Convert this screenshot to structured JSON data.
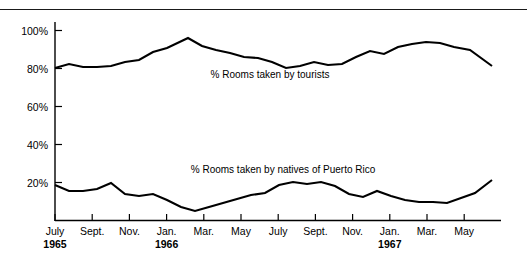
{
  "chart_data": {
    "type": "line",
    "title": "",
    "xlabel": "",
    "ylabel": "",
    "ylim": [
      0,
      107
    ],
    "grid": false,
    "legend_position": "inline-annotation",
    "y_ticks": [
      "20%",
      "40%",
      "60%",
      "80%",
      "100%"
    ],
    "y_tick_values": [
      20,
      40,
      60,
      80,
      100
    ],
    "x_tick_labels": [
      {
        "month": "July",
        "year": "1965"
      },
      {
        "month": "Sept.",
        "year": ""
      },
      {
        "month": "Nov.",
        "year": ""
      },
      {
        "month": "Jan.",
        "year": "1966"
      },
      {
        "month": "Mar.",
        "year": ""
      },
      {
        "month": "May",
        "year": ""
      },
      {
        "month": "July",
        "year": ""
      },
      {
        "month": "Sept.",
        "year": ""
      },
      {
        "month": "Nov.",
        "year": ""
      },
      {
        "month": "Jan.",
        "year": "1967"
      },
      {
        "month": "Mar.",
        "year": ""
      },
      {
        "month": "May",
        "year": ""
      }
    ],
    "x_months": [
      "Jul 1965",
      "Aug 1965",
      "Sep 1965",
      "Oct 1965",
      "Nov 1965",
      "Dec 1965",
      "Jan 1966",
      "Feb 1966",
      "Mar 1966",
      "Apr 1966",
      "May 1966",
      "Jun 1966",
      "Jul 1966",
      "Aug 1966",
      "Sep 1966",
      "Oct 1966",
      "Nov 1966",
      "Dec 1966",
      "Jan 1967",
      "Feb 1967",
      "Mar 1967",
      "Apr 1967",
      "May 1967",
      "Jun 1967"
    ],
    "series": [
      {
        "name": "% Rooms taken by tourists",
        "label": "% Rooms taken by tourists",
        "color": "#000000",
        "values": [
          81,
          84,
          82,
          82,
          83,
          86,
          88,
          92,
          96,
          91,
          89,
          88,
          87,
          83,
          80,
          82,
          81,
          86,
          91,
          89,
          92,
          94,
          94,
          93,
          91,
          83
        ]
      },
      {
        "name": "% Rooms taken by natives of Puerto Rico",
        "label": "% Rooms taken by natives of Puerto Rico",
        "color": "#000000",
        "values": [
          18,
          15,
          15,
          16,
          18,
          14,
          13,
          14,
          11,
          8,
          6,
          8,
          10,
          12,
          14,
          15,
          19,
          20,
          19,
          20,
          18,
          14,
          12,
          15,
          13,
          11,
          9,
          9,
          8,
          11,
          13,
          15,
          21
        ]
      }
    ],
    "annotations": [
      {
        "text": "% Rooms taken by tourists",
        "x_px": 270,
        "y_px": 78
      },
      {
        "text": "% Rooms taken by natives of Puerto Rico",
        "x_px": 283,
        "y_px": 173
      }
    ],
    "series_a_points": [
      [
        55,
        68
      ],
      [
        69,
        64
      ],
      [
        83,
        67
      ],
      [
        97,
        67
      ],
      [
        111,
        66
      ],
      [
        125,
        62
      ],
      [
        139,
        60
      ],
      [
        153,
        52
      ],
      [
        167,
        48
      ],
      [
        188,
        38
      ],
      [
        202,
        46
      ],
      [
        216,
        50
      ],
      [
        230,
        53
      ],
      [
        244,
        57
      ],
      [
        258,
        58
      ],
      [
        272,
        62
      ],
      [
        286,
        68
      ],
      [
        300,
        66
      ],
      [
        314,
        62
      ],
      [
        328,
        65
      ],
      [
        342,
        64
      ],
      [
        356,
        57
      ],
      [
        370,
        51
      ],
      [
        384,
        54
      ],
      [
        398,
        47
      ],
      [
        412,
        44
      ],
      [
        426,
        42
      ],
      [
        440,
        43
      ],
      [
        454,
        47
      ],
      [
        470,
        50
      ],
      [
        492,
        66
      ]
    ],
    "series_b_points": [
      [
        55,
        185
      ],
      [
        69,
        191
      ],
      [
        83,
        191
      ],
      [
        97,
        189
      ],
      [
        111,
        183
      ],
      [
        125,
        194
      ],
      [
        139,
        196
      ],
      [
        153,
        194
      ],
      [
        167,
        200
      ],
      [
        181,
        207
      ],
      [
        195,
        211
      ],
      [
        209,
        207
      ],
      [
        223,
        203
      ],
      [
        237,
        199
      ],
      [
        251,
        195
      ],
      [
        265,
        193
      ],
      [
        279,
        185
      ],
      [
        293,
        182
      ],
      [
        307,
        184
      ],
      [
        321,
        182
      ],
      [
        335,
        186
      ],
      [
        349,
        194
      ],
      [
        363,
        197
      ],
      [
        377,
        191
      ],
      [
        391,
        196
      ],
      [
        405,
        200
      ],
      [
        419,
        202
      ],
      [
        433,
        202
      ],
      [
        447,
        203
      ],
      [
        461,
        198
      ],
      [
        475,
        193
      ],
      [
        492,
        180
      ]
    ]
  }
}
